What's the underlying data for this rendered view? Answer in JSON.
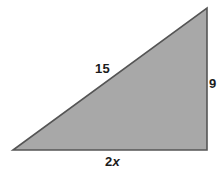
{
  "figure": {
    "kind": "right-triangle-diagram",
    "background_color": "#ffffff",
    "fill_color": "#a8a8a8",
    "stroke_color": "#555555",
    "label_color": "#1c1c1c",
    "vertices": {
      "bottom_left": [
        13,
        150
      ],
      "bottom_right": [
        207,
        150
      ],
      "top_right": [
        207,
        8
      ]
    },
    "labels": {
      "hypotenuse": "15",
      "vertical_leg": "9",
      "horizontal_leg_coefficient": "2",
      "horizontal_leg_variable": "x"
    }
  }
}
